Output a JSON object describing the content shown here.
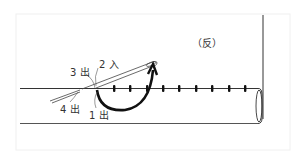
{
  "diagram": {
    "side_label": "（反）",
    "labels": {
      "step1": "1 出",
      "step2": "2 入",
      "step3": "3 出",
      "step4": "4 出"
    },
    "stitch_count": 9,
    "colors": {
      "line": "#333333",
      "thread": "#111111",
      "frame": "#eeeeee",
      "text": "#333333"
    }
  }
}
